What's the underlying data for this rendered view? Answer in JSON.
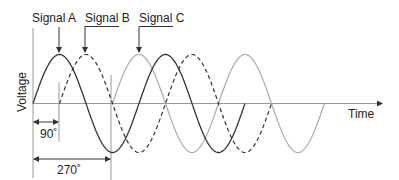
{
  "diagram": {
    "labels": {
      "signal_a": "Signal A",
      "signal_b": "Signal B",
      "signal_c": "Signal C",
      "y_axis": "Voltage",
      "x_axis": "Time",
      "phase_90": "90˚",
      "phase_270": "270˚"
    },
    "signals": [
      {
        "name": "Signal A",
        "style": "solid",
        "color": "#333333",
        "phase_deg": 0
      },
      {
        "name": "Signal B",
        "style": "dashed",
        "color": "#333333",
        "phase_deg": 90
      },
      {
        "name": "Signal C",
        "style": "solid-light",
        "color": "#aaaaaa",
        "phase_deg": 270
      }
    ],
    "cycles_shown": 2
  }
}
